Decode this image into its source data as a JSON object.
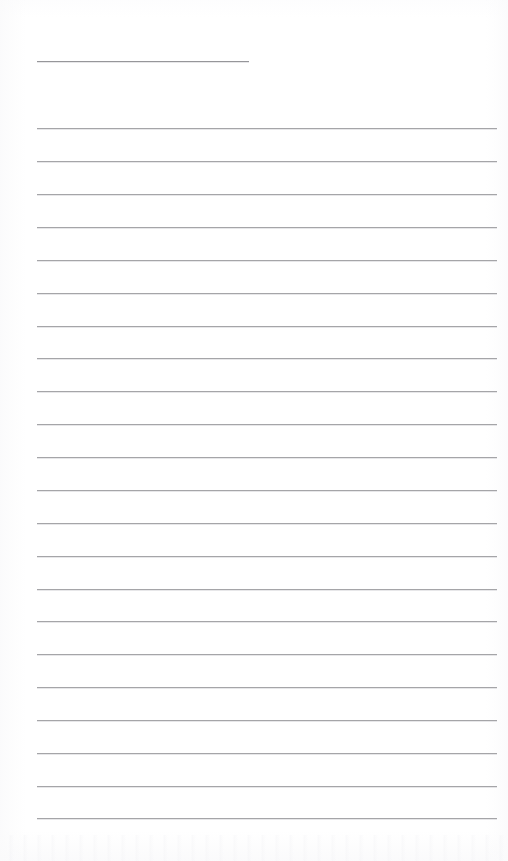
{
  "document": {
    "kind": "lined-writing-paper",
    "title_text": "",
    "body_text": "",
    "page_width": 508,
    "page_height": 861,
    "background_color": "#ffffff",
    "rule_color": "#9e9ea1",
    "title_rule_color": "#8e8e92",
    "margins": {
      "left": 37,
      "right": 497
    },
    "title_rule": {
      "label": "title-rule",
      "x_start": 37,
      "x_end": 249,
      "y": 61,
      "width": 212
    },
    "rule_geometry": {
      "first_y": 128,
      "spacing": 32.86,
      "count": 22,
      "x_start": 37,
      "x_end": 497,
      "width": 460
    },
    "rules": [
      {
        "index": 1,
        "y": 128
      },
      {
        "index": 2,
        "y": 161
      },
      {
        "index": 3,
        "y": 194
      },
      {
        "index": 4,
        "y": 227
      },
      {
        "index": 5,
        "y": 260
      },
      {
        "index": 6,
        "y": 293
      },
      {
        "index": 7,
        "y": 326
      },
      {
        "index": 8,
        "y": 358
      },
      {
        "index": 9,
        "y": 391
      },
      {
        "index": 10,
        "y": 424
      },
      {
        "index": 11,
        "y": 457
      },
      {
        "index": 12,
        "y": 490
      },
      {
        "index": 13,
        "y": 523
      },
      {
        "index": 14,
        "y": 556
      },
      {
        "index": 15,
        "y": 589
      },
      {
        "index": 16,
        "y": 621
      },
      {
        "index": 17,
        "y": 654
      },
      {
        "index": 18,
        "y": 687
      },
      {
        "index": 19,
        "y": 720
      },
      {
        "index": 20,
        "y": 753
      },
      {
        "index": 21,
        "y": 786
      },
      {
        "index": 22,
        "y": 818
      }
    ]
  }
}
